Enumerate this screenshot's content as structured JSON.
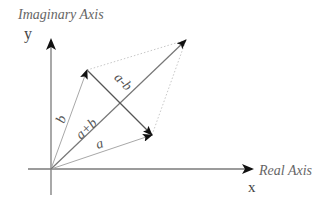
{
  "axes": {
    "y_axis_title": "Imaginary Axis",
    "y_axis_symbol": "y",
    "x_axis_title": "Real Axis",
    "x_axis_symbol": "x"
  },
  "vectors": {
    "a": {
      "label": "a",
      "from": [
        51,
        169
      ],
      "to": [
        152,
        135
      ]
    },
    "b": {
      "label": "b",
      "from": [
        51,
        169
      ],
      "to": [
        87,
        70
      ]
    },
    "a_plus_b": {
      "label": "a+b",
      "from": [
        51,
        169
      ],
      "to": [
        186,
        40
      ]
    },
    "a_minus_b": {
      "label": "a-b",
      "from": [
        87,
        70
      ],
      "to": [
        152,
        135
      ]
    }
  },
  "colors": {
    "axis": "#7a7a7a",
    "vector_light": "#a8a8a8",
    "vector_dark": "#555555",
    "arrowhead": "#111111",
    "dotted": "#c8c8c8",
    "label": "#555555"
  }
}
